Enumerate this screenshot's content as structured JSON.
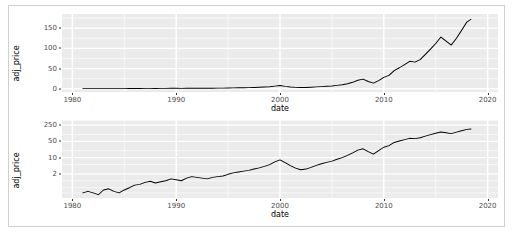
{
  "page": {
    "background_color": "#ffffff",
    "frame_color": "#cfcfcf"
  },
  "style": {
    "panel_fill": "#ebebeb",
    "grid_major_color": "#ffffff",
    "grid_minor_color": "#ffffff",
    "line_color": "#000000",
    "tick_label_color": "#4d4d4d",
    "axis_title_color": "#000000"
  },
  "chart_data": [
    {
      "id": "linear-price-chart",
      "type": "line",
      "title": "",
      "xlabel": "date",
      "ylabel": "adj_price",
      "xlim": [
        1979.0,
        2021.0
      ],
      "ylim": [
        -8,
        185
      ],
      "yscale": "linear",
      "grid": true,
      "legend": "none",
      "xticks": [
        1980,
        1990,
        2000,
        2010,
        2020
      ],
      "xtick_labels": [
        "1980",
        "1990",
        "2000",
        "2010",
        "2020"
      ],
      "yticks": [
        0,
        50,
        100,
        150
      ],
      "ytick_labels": [
        "0",
        "50",
        "100",
        "150"
      ],
      "y_minor_ticks": [
        25,
        75,
        125,
        175
      ],
      "x_minor_ticks": [
        1985,
        1995,
        2005,
        2015
      ],
      "series": [
        {
          "name": "adj_price",
          "x": [
            1981.0,
            1981.5,
            1982.0,
            1982.5,
            1983.0,
            1983.5,
            1984.0,
            1984.5,
            1985.0,
            1985.5,
            1986.0,
            1986.5,
            1987.0,
            1987.5,
            1988.0,
            1988.5,
            1989.0,
            1989.5,
            1990.0,
            1990.5,
            1991.0,
            1991.5,
            1992.0,
            1992.5,
            1993.0,
            1993.5,
            1994.0,
            1994.5,
            1995.0,
            1995.5,
            1996.0,
            1996.5,
            1997.0,
            1997.5,
            1998.0,
            1998.5,
            1999.0,
            1999.5,
            2000.0,
            2000.5,
            2001.0,
            2001.5,
            2002.0,
            2002.5,
            2003.0,
            2003.5,
            2004.0,
            2004.5,
            2005.0,
            2005.5,
            2006.0,
            2006.5,
            2007.0,
            2007.5,
            2008.0,
            2008.5,
            2009.0,
            2009.5,
            2010.0,
            2010.5,
            2011.0,
            2011.5,
            2012.0,
            2012.5,
            2013.0,
            2013.5,
            2014.0,
            2014.5,
            2015.0,
            2015.5,
            2016.0,
            2016.5,
            2017.0,
            2017.5,
            2018.0,
            2018.4
          ],
          "y": [
            0.3,
            0.35,
            0.3,
            0.25,
            0.4,
            0.45,
            0.35,
            0.3,
            0.4,
            0.5,
            0.65,
            0.7,
            0.85,
            0.95,
            0.8,
            0.9,
            1.0,
            1.2,
            1.1,
            1.0,
            1.3,
            1.5,
            1.4,
            1.3,
            1.2,
            1.4,
            1.5,
            1.6,
            1.9,
            2.2,
            2.4,
            2.6,
            2.8,
            3.2,
            3.6,
            4.2,
            5.0,
            6.5,
            8.0,
            6.0,
            4.5,
            3.5,
            3.0,
            3.2,
            3.8,
            4.6,
            5.4,
            6.2,
            7.0,
            8.5,
            10.0,
            12.5,
            16.0,
            21.0,
            24.0,
            18.0,
            14.0,
            20.0,
            28.0,
            33.0,
            45.0,
            52.0,
            60.0,
            68.0,
            66.0,
            72.0,
            85.0,
            98.0,
            112.0,
            128.0,
            118.0,
            108.0,
            125.0,
            145.0,
            165.0,
            172.0
          ]
        }
      ]
    },
    {
      "id": "log-price-chart",
      "type": "line",
      "title": "",
      "xlabel": "date",
      "ylabel": "adj_price",
      "xlim": [
        1979.0,
        2021.0
      ],
      "ylim": [
        0.18,
        420
      ],
      "yscale": "log",
      "grid": true,
      "legend": "none",
      "xticks": [
        1980,
        1990,
        2000,
        2010,
        2020
      ],
      "xtick_labels": [
        "1980",
        "1990",
        "2000",
        "2010",
        "2020"
      ],
      "yticks": [
        2,
        10,
        50,
        250
      ],
      "ytick_labels": [
        "2",
        "10",
        "50",
        "250"
      ],
      "y_minor_ticks": [
        0.3,
        0.5,
        1,
        5,
        20,
        100,
        400
      ],
      "x_minor_ticks": [
        1985,
        1995,
        2005,
        2015
      ],
      "series": [
        {
          "name": "adj_price",
          "x": [
            1981.0,
            1981.5,
            1982.0,
            1982.5,
            1983.0,
            1983.5,
            1984.0,
            1984.5,
            1985.0,
            1985.5,
            1986.0,
            1986.5,
            1987.0,
            1987.5,
            1988.0,
            1988.5,
            1989.0,
            1989.5,
            1990.0,
            1990.5,
            1991.0,
            1991.5,
            1992.0,
            1992.5,
            1993.0,
            1993.5,
            1994.0,
            1994.5,
            1995.0,
            1995.5,
            1996.0,
            1996.5,
            1997.0,
            1997.5,
            1998.0,
            1998.5,
            1999.0,
            1999.5,
            2000.0,
            2000.5,
            2001.0,
            2001.5,
            2002.0,
            2002.5,
            2003.0,
            2003.5,
            2004.0,
            2004.5,
            2005.0,
            2005.5,
            2006.0,
            2006.5,
            2007.0,
            2007.5,
            2008.0,
            2008.5,
            2009.0,
            2009.5,
            2010.0,
            2010.5,
            2011.0,
            2011.5,
            2012.0,
            2012.5,
            2013.0,
            2013.5,
            2014.0,
            2014.5,
            2015.0,
            2015.5,
            2016.0,
            2016.5,
            2017.0,
            2017.5,
            2018.0,
            2018.4
          ],
          "y": [
            0.3,
            0.35,
            0.3,
            0.25,
            0.4,
            0.45,
            0.35,
            0.3,
            0.4,
            0.5,
            0.65,
            0.7,
            0.85,
            0.95,
            0.8,
            0.9,
            1.0,
            1.2,
            1.1,
            1.0,
            1.3,
            1.5,
            1.4,
            1.3,
            1.2,
            1.4,
            1.5,
            1.6,
            1.9,
            2.2,
            2.4,
            2.6,
            2.8,
            3.2,
            3.6,
            4.2,
            5.0,
            6.5,
            8.0,
            6.0,
            4.5,
            3.5,
            3.0,
            3.2,
            3.8,
            4.6,
            5.4,
            6.2,
            7.0,
            8.5,
            10.0,
            12.5,
            16.0,
            21.0,
            24.0,
            18.0,
            14.0,
            20.0,
            28.0,
            33.0,
            45.0,
            52.0,
            60.0,
            68.0,
            66.0,
            72.0,
            85.0,
            98.0,
            112.0,
            128.0,
            118.0,
            108.0,
            125.0,
            145.0,
            165.0,
            172.0
          ]
        }
      ]
    }
  ]
}
